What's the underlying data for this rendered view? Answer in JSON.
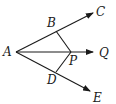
{
  "diagram": {
    "type": "geometry",
    "points": {
      "A": {
        "label": "A",
        "x": 16,
        "y": 52
      },
      "B": {
        "label": "B",
        "x": 56,
        "y": 31
      },
      "C": {
        "label": "C",
        "x": 93,
        "y": 13
      },
      "P": {
        "label": "P",
        "x": 71,
        "y": 52
      },
      "Q": {
        "label": "Q",
        "x": 93,
        "y": 52
      },
      "D": {
        "label": "D",
        "x": 56,
        "y": 72
      },
      "E": {
        "label": "E",
        "x": 90,
        "y": 91
      }
    },
    "rays": [
      "AC",
      "AQ",
      "AE"
    ],
    "segments": [
      "BP",
      "DP"
    ],
    "stroke_color": "#1a1a1a"
  }
}
